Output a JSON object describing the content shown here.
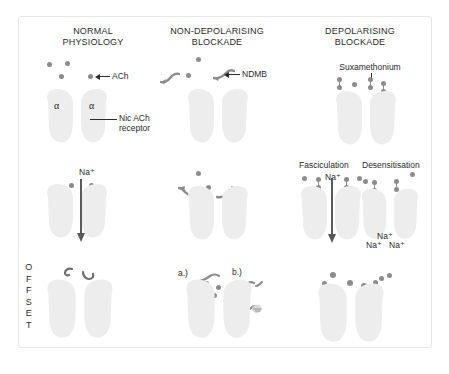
{
  "figure": {
    "title_normal": "NORMAL\nPHYSIOLOGY",
    "title_nondep": "NON-DEPOLARISING\nBLOCKADE",
    "title_dep": "DEPOLARISING\nBLOCKADE"
  },
  "labels": {
    "ach": "ACh",
    "nic_ach_receptor": "Nic ACh\nreceptor",
    "alpha_left": "α",
    "alpha_right": "α",
    "ndmb": "NDMB",
    "suxamethonium": "Suxamethonium",
    "fasciculation": "Fasciculation",
    "desensitisation": "Desensitisation",
    "na_col1": "Na⁺",
    "na_col3": "Na⁺",
    "na_pool_top": "Na⁺",
    "na_pool_left": "Na⁺",
    "na_pool_right": "Na⁺",
    "offset": "OFFSET",
    "offset_letters": [
      "O",
      "F",
      "F",
      "S",
      "E",
      "T"
    ],
    "step_a": "a.)",
    "step_b": "b.)",
    "step_c": "c.)"
  },
  "colors": {
    "frame_border": "#e6e6e6",
    "background": "#ffffff",
    "text": "#2b2b2b",
    "receptor_fill": "#ededed",
    "molecule": "#8c8c8c",
    "arrow": "#5a5a5a"
  },
  "rows": {
    "row1_name": "binding",
    "row2_name": "channel-response",
    "row3_name": "offset"
  },
  "counts": {
    "ach_normal_top": 4,
    "ach_nondep_top": 2,
    "sux_dumbbells_top": 3,
    "sux_free_dots_top": 2,
    "na_dots_col1": 2,
    "ach_nondep_mid": 2,
    "sux_fasciculation": 2,
    "sux_desensitisation": 2,
    "ach_offset_nondep": 5,
    "sux_offset_dep": 7
  }
}
